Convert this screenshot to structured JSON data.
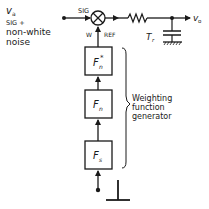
{
  "input": {
    "symbol": "v",
    "symbol_sub": "a",
    "line1": "SIG +",
    "line2": "non-white",
    "line3": "noise"
  },
  "multiplier": {
    "sig_label": "SIG",
    "w_label": "W",
    "ref_label": "REF"
  },
  "filter": {
    "time_constant_symbol": "T",
    "time_constant_sub": "r"
  },
  "output": {
    "symbol": "v",
    "symbol_sub": "o"
  },
  "blocks": [
    {
      "symbol": "F",
      "sub": "n",
      "sup": "*"
    },
    {
      "symbol": "F",
      "sub": "n",
      "sup": ""
    },
    {
      "symbol": "F",
      "sub": "s",
      "sup": ""
    }
  ],
  "generator": {
    "line1": "Weighting",
    "line2": "function",
    "line3": "generator"
  },
  "colors": {
    "ink": "#1a1a1a",
    "background": "#ffffff"
  }
}
